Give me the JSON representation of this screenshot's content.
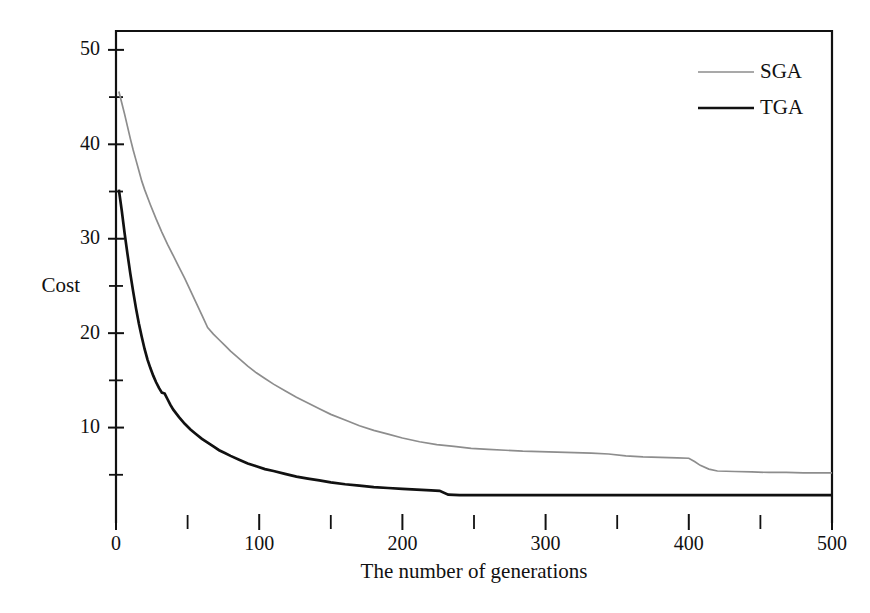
{
  "chart_data": {
    "type": "line",
    "title": "",
    "xlabel": "The number of generations",
    "ylabel": "Cost",
    "xlim": [
      0,
      500
    ],
    "ylim": [
      0,
      52
    ],
    "grid": false,
    "legend_position": "top-right",
    "x_ticks_major": [
      0,
      100,
      200,
      300,
      400,
      500
    ],
    "x_ticks_minor": [
      50,
      150,
      250,
      350,
      450
    ],
    "x_tick_labels": [
      "0",
      "100",
      "200",
      "300",
      "400",
      "500"
    ],
    "y_ticks_major": [
      10,
      20,
      30,
      40,
      50
    ],
    "y_ticks_minor": [
      5,
      15,
      25,
      35,
      45
    ],
    "y_tick_labels": [
      "10",
      "20",
      "30",
      "40",
      "50"
    ],
    "series": [
      {
        "name": "SGA",
        "color": "#8d8d8d",
        "line_width": 1.7,
        "x": [
          2,
          4,
          6,
          8,
          10,
          12,
          14,
          16,
          18,
          20,
          24,
          28,
          32,
          36,
          40,
          44,
          48,
          52,
          56,
          60,
          64,
          68,
          72,
          76,
          80,
          86,
          92,
          98,
          104,
          110,
          118,
          126,
          134,
          142,
          150,
          160,
          170,
          180,
          190,
          200,
          212,
          224,
          236,
          248,
          260,
          272,
          284,
          296,
          308,
          320,
          332,
          344,
          356,
          368,
          380,
          392,
          400,
          404,
          408,
          414,
          420,
          432,
          444,
          456,
          468,
          480,
          492,
          500
        ],
        "y": [
          45.6,
          44.4,
          43.2,
          41.9,
          40.6,
          39.4,
          38.3,
          37.2,
          36.1,
          35.2,
          33.6,
          32.1,
          30.7,
          29.4,
          28.2,
          27.0,
          25.8,
          24.5,
          23.2,
          21.9,
          20.6,
          19.9,
          19.3,
          18.7,
          18.1,
          17.3,
          16.5,
          15.8,
          15.2,
          14.6,
          13.9,
          13.2,
          12.6,
          12.0,
          11.4,
          10.8,
          10.2,
          9.7,
          9.3,
          8.9,
          8.5,
          8.2,
          8.0,
          7.8,
          7.7,
          7.6,
          7.5,
          7.45,
          7.4,
          7.35,
          7.3,
          7.2,
          7.0,
          6.9,
          6.85,
          6.8,
          6.75,
          6.4,
          6.0,
          5.6,
          5.4,
          5.35,
          5.3,
          5.25,
          5.25,
          5.2,
          5.2,
          5.2
        ]
      },
      {
        "name": "TGA",
        "color": "#111111",
        "line_width": 2.7,
        "x": [
          2,
          4,
          6,
          8,
          10,
          12,
          14,
          16,
          18,
          20,
          22,
          24,
          26,
          28,
          30,
          32,
          34,
          36,
          38,
          40,
          44,
          48,
          52,
          56,
          60,
          64,
          68,
          72,
          76,
          80,
          86,
          92,
          98,
          104,
          110,
          118,
          126,
          134,
          142,
          150,
          160,
          170,
          180,
          190,
          200,
          210,
          220,
          226,
          232,
          240,
          260,
          280,
          300,
          320,
          340,
          360,
          380,
          400,
          420,
          440,
          460,
          480,
          500
        ],
        "y": [
          35.2,
          33.0,
          30.6,
          28.4,
          26.3,
          24.4,
          22.6,
          21.0,
          19.6,
          18.3,
          17.2,
          16.3,
          15.5,
          14.8,
          14.2,
          13.7,
          13.6,
          13.0,
          12.4,
          11.9,
          11.1,
          10.4,
          9.8,
          9.3,
          8.8,
          8.4,
          8.0,
          7.6,
          7.3,
          7.0,
          6.6,
          6.2,
          5.9,
          5.6,
          5.4,
          5.1,
          4.8,
          4.6,
          4.4,
          4.2,
          4.0,
          3.85,
          3.7,
          3.6,
          3.5,
          3.42,
          3.35,
          3.3,
          2.9,
          2.85,
          2.85,
          2.85,
          2.85,
          2.85,
          2.85,
          2.85,
          2.85,
          2.85,
          2.85,
          2.85,
          2.85,
          2.85,
          2.85
        ]
      }
    ],
    "legend": [
      {
        "label": "SGA",
        "color": "#8d8d8d",
        "line_width": 1.7
      },
      {
        "label": "TGA",
        "color": "#111111",
        "line_width": 2.7
      }
    ]
  },
  "plot_box": {
    "left": 116,
    "right": 832,
    "top": 31,
    "bottom": 522
  }
}
